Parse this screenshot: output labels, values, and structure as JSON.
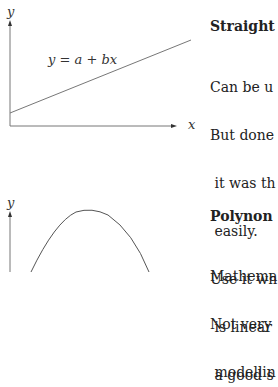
{
  "section1": {
    "figure": {
      "y_axis_label": "y",
      "x_axis_label": "x",
      "equation": "y = a + bx"
    },
    "heading": "Straight",
    "lines": [
      "Can be u",
      "But done",
      " it was th",
      " easily.",
      "Use it wh",
      " is linear",
      " a good s"
    ]
  },
  "section2": {
    "figure": {
      "y_axis_label": "y"
    },
    "heading": "Polynon",
    "lines": [
      "Mathema",
      "Not very",
      " modellin"
    ]
  }
}
